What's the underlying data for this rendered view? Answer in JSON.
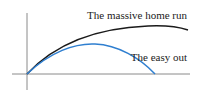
{
  "diagram": {
    "type": "trajectory-comparison",
    "labels": {
      "home_run": "The massive home run",
      "easy_out": "The easy out"
    },
    "colors": {
      "axis": "#8a8a8a",
      "home_run_curve": "#1a1a1a",
      "easy_out_curve": "#2f7fd0",
      "text": "#222222"
    }
  }
}
